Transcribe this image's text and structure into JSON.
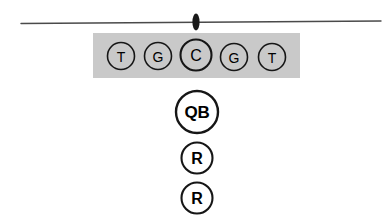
{
  "diagram": {
    "type": "football-offensive-formation",
    "background_color": "#ffffff",
    "stroke_color": "#161616"
  },
  "scrimmage": {
    "name": "line-of-scrimmage",
    "x1": 21,
    "y1": 23.5,
    "x2": 381,
    "y2": 21.0,
    "color": "#4a4a4a",
    "thickness": 1.4
  },
  "ball": {
    "name": "football-marker",
    "cx": 196,
    "cy": 22,
    "rx": 3.6,
    "ry": 8.5,
    "color": "#1a1a1a"
  },
  "line_box": {
    "name": "offensive-line-highlight",
    "x": 93,
    "y": 33,
    "width": 207,
    "height": 45,
    "color": "#c9c9c9"
  },
  "offensive_line": [
    {
      "label": "T",
      "role": "left-tackle",
      "cx": 121,
      "cy": 56,
      "r": 13.5,
      "size": "normal"
    },
    {
      "label": "G",
      "role": "left-guard",
      "cx": 158,
      "cy": 56,
      "r": 13.5,
      "size": "normal"
    },
    {
      "label": "C",
      "role": "center",
      "cx": 196,
      "cy": 55,
      "r": 15.5,
      "size": "large"
    },
    {
      "label": "G",
      "role": "right-guard",
      "cx": 234,
      "cy": 57,
      "r": 13.5,
      "size": "normal"
    },
    {
      "label": "T",
      "role": "right-tackle",
      "cx": 272,
      "cy": 57,
      "r": 13.5,
      "size": "normal"
    }
  ],
  "backfield": [
    {
      "label": "QB",
      "role": "quarterback",
      "cx": 197,
      "cy": 112,
      "r": 21.0,
      "size": "qb"
    },
    {
      "label": "R",
      "role": "running-back-1",
      "cx": 197,
      "cy": 158,
      "r": 15.5,
      "size": "back"
    },
    {
      "label": "R",
      "role": "running-back-2",
      "cx": 197,
      "cy": 198,
      "r": 15.5,
      "size": "back"
    }
  ]
}
